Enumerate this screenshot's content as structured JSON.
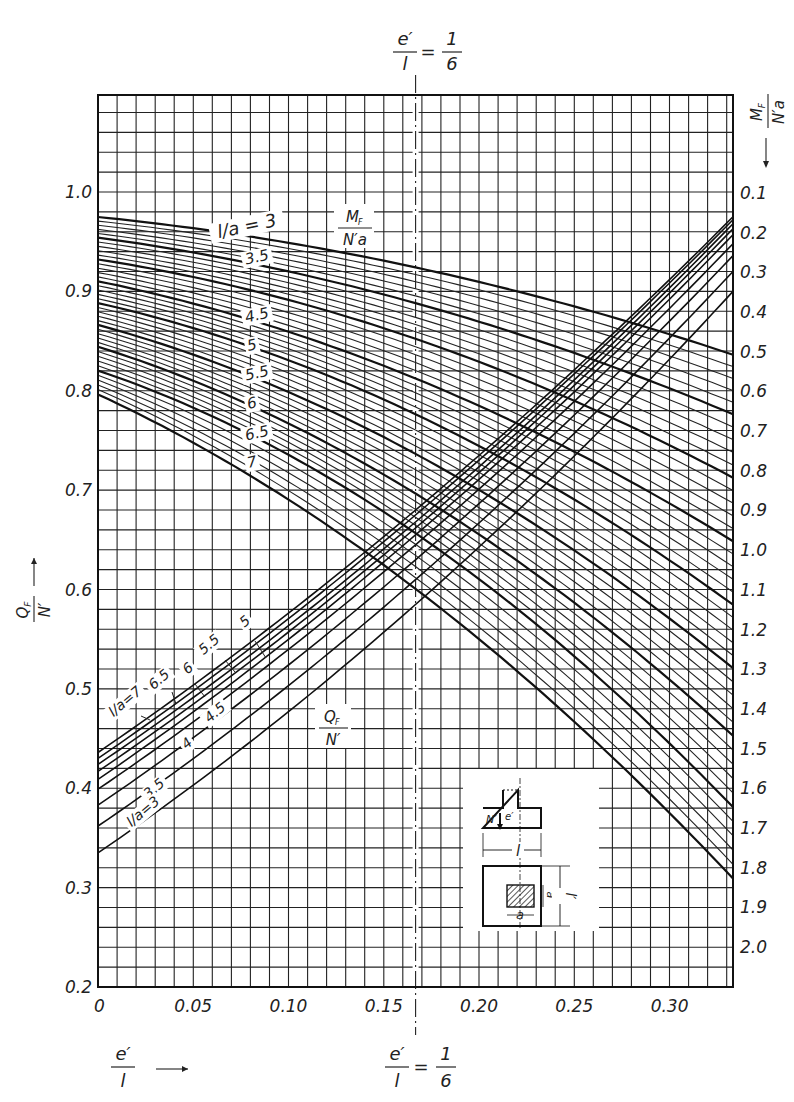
{
  "chart_data": {
    "type": "line",
    "title": "",
    "top_annotation": {
      "lhs_num": "e′",
      "lhs_den": "l",
      "eq": "=",
      "rhs_num": "1",
      "rhs_den": "6"
    },
    "bottom_annotation": {
      "lhs_num": "e′",
      "lhs_den": "l",
      "eq": "=",
      "rhs_num": "1",
      "rhs_den": "6"
    },
    "xlabel": {
      "num": "e′",
      "den": "l",
      "arrow": "⟶"
    },
    "ylabel_left": {
      "num": "Q",
      "sub": "F",
      "den": "N′",
      "arrow": "⟶"
    },
    "ylabel_right": {
      "num": "M",
      "sub": "F",
      "den": "N′a",
      "arrow": "⟶"
    },
    "xlim": [
      0,
      0.3333
    ],
    "ylim_left": [
      0.2,
      1.1
    ],
    "ylim_right": [
      0.0,
      2.1
    ],
    "x_ticks": [
      "0",
      "0.05",
      "0.10",
      "0.15",
      "0.20",
      "0.25",
      "0.30"
    ],
    "x_tick_values": [
      0,
      0.05,
      0.1,
      0.15,
      0.2,
      0.25,
      0.3
    ],
    "y_left_ticks": [
      "0.2",
      "0.3",
      "0.4",
      "0.5",
      "0.6",
      "0.7",
      "0.8",
      "0.9",
      "1.0"
    ],
    "y_left_tick_values": [
      0.2,
      0.3,
      0.4,
      0.5,
      0.6,
      0.7,
      0.8,
      0.9,
      1.0
    ],
    "y_right_ticks": [
      "0.1",
      "0.2",
      "0.3",
      "0.4",
      "0.5",
      "0.6",
      "0.7",
      "0.8",
      "0.9",
      "1.0",
      "1.1",
      "1.2",
      "1.3",
      "1.4",
      "1.5",
      "1.6",
      "1.7",
      "1.8",
      "1.9",
      "2.0"
    ],
    "y_right_tick_values": [
      0.1,
      0.2,
      0.3,
      0.4,
      0.5,
      0.6,
      0.7,
      0.8,
      0.9,
      1.0,
      1.1,
      1.2,
      1.3,
      1.4,
      1.5,
      1.6,
      1.7,
      1.8,
      1.9,
      2.0
    ],
    "grid": {
      "on": true,
      "x_step": 0.01,
      "y_left_step": 0.02
    },
    "reference_line": {
      "x": 0.1667,
      "style": "dash-dot",
      "label": "e′/l = 1/6"
    },
    "mf_series_label": {
      "num": "M",
      "sub": "F",
      "den": "N′a"
    },
    "qf_series_label": {
      "num": "Q",
      "sub": "F",
      "den": "N′"
    },
    "mf_series": [
      {
        "name": "l/a=3",
        "label": "l/a = 3",
        "major": true,
        "x": [
          0,
          0.1667,
          0.3333
        ],
        "y_right": [
          0.163,
          0.29,
          0.51
        ]
      },
      {
        "name": "l/a=3.5",
        "label": "3.5",
        "major": true,
        "x": [
          0,
          0.1667,
          0.3333
        ],
        "y_right": [
          0.215,
          0.38,
          0.66
        ]
      },
      {
        "name": "l/a=4",
        "label": "",
        "major": true,
        "x": [
          0,
          0.1667,
          0.3333
        ],
        "y_right": [
          0.27,
          0.47,
          0.82
        ]
      },
      {
        "name": "l/a=4.5",
        "label": "4.5",
        "major": true,
        "x": [
          0,
          0.1667,
          0.3333
        ],
        "y_right": [
          0.325,
          0.57,
          0.98
        ]
      },
      {
        "name": "l/a=5",
        "label": "5",
        "major": true,
        "x": [
          0,
          0.1667,
          0.3333
        ],
        "y_right": [
          0.38,
          0.66,
          1.14
        ]
      },
      {
        "name": "l/a=5.5",
        "label": "5.5",
        "major": true,
        "x": [
          0,
          0.1667,
          0.3333
        ],
        "y_right": [
          0.435,
          0.76,
          1.3
        ]
      },
      {
        "name": "l/a=6",
        "label": "6",
        "major": true,
        "x": [
          0,
          0.1667,
          0.3333
        ],
        "y_right": [
          0.49,
          0.86,
          1.47
        ]
      },
      {
        "name": "l/a=6.5",
        "label": "6.5",
        "major": true,
        "x": [
          0,
          0.1667,
          0.3333
        ],
        "y_right": [
          0.55,
          0.96,
          1.65
        ]
      },
      {
        "name": "l/a=7",
        "label": "7",
        "major": true,
        "x": [
          0,
          0.1667,
          0.3333
        ],
        "y_right": [
          0.61,
          1.1,
          1.83
        ]
      }
    ],
    "qf_series": [
      {
        "name": "l/a=7",
        "label": "l/a=7",
        "x": [
          0,
          0.1667,
          0.3333
        ],
        "y_left": [
          0.436,
          0.68,
          0.975
        ]
      },
      {
        "name": "l/a=6.5",
        "label": "6.5",
        "x": [
          0,
          0.1667,
          0.3333
        ],
        "y_left": [
          0.43,
          0.675,
          0.972
        ]
      },
      {
        "name": "l/a=6",
        "label": "6",
        "x": [
          0,
          0.1667,
          0.3333
        ],
        "y_left": [
          0.424,
          0.668,
          0.968
        ]
      },
      {
        "name": "l/a=5.5",
        "label": "5.5",
        "x": [
          0,
          0.1667,
          0.3333
        ],
        "y_left": [
          0.417,
          0.662,
          0.963
        ]
      },
      {
        "name": "l/a=5",
        "label": "5",
        "x": [
          0,
          0.1667,
          0.3333
        ],
        "y_left": [
          0.409,
          0.655,
          0.957
        ]
      },
      {
        "name": "l/a=4.5",
        "label": "4.5",
        "x": [
          0,
          0.1667,
          0.3333
        ],
        "y_left": [
          0.399,
          0.645,
          0.948
        ]
      },
      {
        "name": "l/a=4",
        "label": "4",
        "x": [
          0,
          0.1667,
          0.3333
        ],
        "y_left": [
          0.383,
          0.63,
          0.936
        ]
      },
      {
        "name": "l/a=3.5",
        "label": "3.5",
        "x": [
          0,
          0.1667,
          0.3333
        ],
        "y_left": [
          0.362,
          0.61,
          0.92
        ]
      },
      {
        "name": "l/a=3",
        "label": "l/a=3",
        "x": [
          0,
          0.1667,
          0.3333
        ],
        "y_left": [
          0.335,
          0.585,
          0.9
        ]
      }
    ],
    "inset": {
      "labels": {
        "N": "N′",
        "e": "e′",
        "l": "l",
        "lp": "l′",
        "a": "a",
        "ap": "a′"
      }
    }
  }
}
